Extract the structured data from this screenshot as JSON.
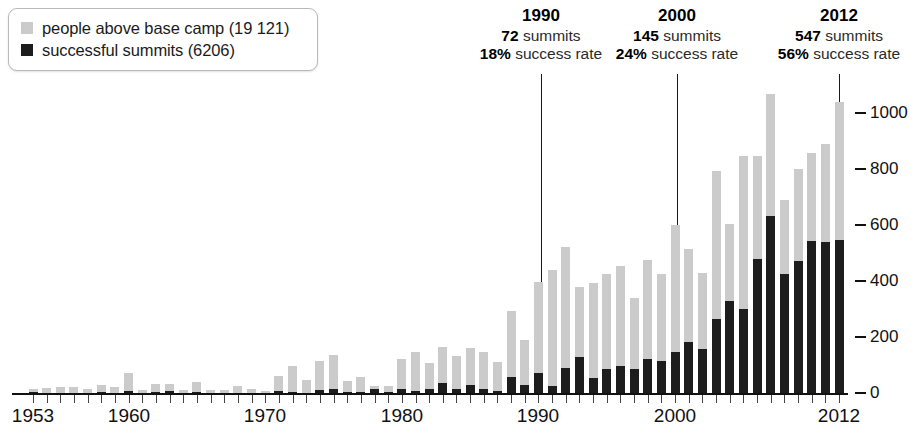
{
  "legend": {
    "items": [
      {
        "label": "people above base camp (19 121)",
        "color": "#cbcbcb",
        "icon": "square-swatch-gray"
      },
      {
        "label": "successful summits (6206)",
        "color": "#1d1d1d",
        "icon": "square-swatch-black"
      }
    ]
  },
  "annotations": [
    {
      "year": "1990",
      "summits": "72",
      "summits_word": "summits",
      "rate": "18%",
      "rate_word": "success rate"
    },
    {
      "year": "2000",
      "summits": "145",
      "summits_word": "summits",
      "rate": "24%",
      "rate_word": "success rate"
    },
    {
      "year": "2012",
      "summits": "547",
      "summits_word": "summits",
      "rate": "56%",
      "rate_word": "success rate"
    }
  ],
  "chart_data": {
    "type": "bar",
    "title": "",
    "subtitle": "",
    "xlabel": "",
    "ylabel": "",
    "grid": false,
    "legend_position": "top-left",
    "stacked": false,
    "overlaid": true,
    "xlim": [
      1953,
      2012
    ],
    "ylim": [
      0,
      1100
    ],
    "yticks": [
      0,
      200,
      400,
      600,
      800,
      1000
    ],
    "ytick_labels": [
      "0",
      "200",
      "400",
      "600",
      "800",
      "1000"
    ],
    "xtick_labels": [
      "1953",
      "1960",
      "1970",
      "1980",
      "1990",
      "2000",
      "2012"
    ],
    "xtick_years": [
      1953,
      1960,
      1970,
      1980,
      1990,
      2000,
      2012
    ],
    "categories": [
      1953,
      1954,
      1955,
      1956,
      1957,
      1958,
      1959,
      1960,
      1961,
      1962,
      1963,
      1964,
      1965,
      1966,
      1967,
      1968,
      1969,
      1970,
      1971,
      1972,
      1973,
      1974,
      1975,
      1976,
      1977,
      1978,
      1979,
      1980,
      1981,
      1982,
      1983,
      1984,
      1985,
      1986,
      1987,
      1988,
      1989,
      1990,
      1991,
      1992,
      1993,
      1994,
      1995,
      1996,
      1997,
      1998,
      1999,
      2000,
      2001,
      2002,
      2003,
      2004,
      2005,
      2006,
      2007,
      2008,
      2009,
      2010,
      2011,
      2012
    ],
    "series": [
      {
        "name": "people above base camp (19 121)",
        "color": "#cbcbcb",
        "values": [
          14,
          18,
          20,
          22,
          14,
          30,
          22,
          73,
          12,
          32,
          32,
          12,
          38,
          10,
          10,
          26,
          14,
          8,
          62,
          96,
          46,
          115,
          134,
          42,
          58,
          24,
          24,
          120,
          148,
          108,
          166,
          132,
          160,
          148,
          112,
          294,
          188,
          398,
          438,
          520,
          378,
          394,
          424,
          452,
          340,
          476,
          424,
          600,
          514,
          428,
          794,
          604,
          848,
          848,
          1068,
          688,
          800,
          856,
          890,
          1040
        ]
      },
      {
        "name": "successful summits (6206)",
        "color": "#1d1d1d",
        "values": [
          2,
          0,
          0,
          0,
          0,
          4,
          0,
          6,
          0,
          4,
          6,
          0,
          4,
          0,
          0,
          0,
          0,
          0,
          8,
          2,
          0,
          10,
          14,
          4,
          2,
          16,
          4,
          14,
          6,
          16,
          36,
          16,
          30,
          14,
          8,
          56,
          30,
          72,
          24,
          90,
          130,
          54,
          84,
          98,
          86,
          120,
          116,
          145,
          182,
          158,
          266,
          330,
          300,
          480,
          633,
          424,
          470,
          542,
          538,
          547
        ]
      }
    ]
  }
}
